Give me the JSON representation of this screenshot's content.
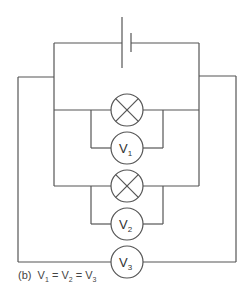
{
  "diagram": {
    "type": "circuit",
    "battery": {
      "label": "cell"
    },
    "lamps": [
      {
        "id": "lamp-1",
        "symbol": "crossed-circle"
      },
      {
        "id": "lamp-2",
        "symbol": "crossed-circle"
      }
    ],
    "voltmeters": [
      {
        "id": "V1",
        "letter": "V",
        "sub": "1",
        "across": "lamp-1"
      },
      {
        "id": "V2",
        "letter": "V",
        "sub": "2",
        "across": "lamp-2"
      },
      {
        "id": "V3",
        "letter": "V",
        "sub": "3",
        "across": "battery"
      }
    ],
    "colors": {
      "wire": "#555555",
      "text": "#333333",
      "background": "#ffffff"
    }
  },
  "caption": {
    "prefix": "(b)",
    "v1": "V",
    "v1_sub": "1",
    "eq1": "=",
    "v2": "V",
    "v2_sub": "2",
    "eq2": "=",
    "v3": "V",
    "v3_sub": "3"
  }
}
